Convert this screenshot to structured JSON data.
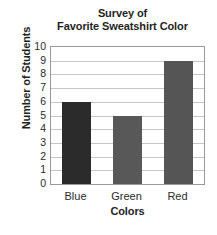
{
  "chart_data": {
    "type": "bar",
    "title": "Survey of Favorite Sweatshirt Color",
    "title_lines": [
      "Survey of",
      "Favorite Sweatshirt Color"
    ],
    "categories": [
      "Blue",
      "Green",
      "Red"
    ],
    "values": [
      6,
      5,
      9
    ],
    "xlabel": "Colors",
    "ylabel": "Number of Students",
    "ylim": [
      0,
      10
    ],
    "ytick_labels": [
      "10",
      "9",
      "8",
      "7",
      "6",
      "5",
      "4",
      "3",
      "2",
      "1",
      "0"
    ],
    "ytick_values": [
      10,
      9,
      8,
      7,
      6,
      5,
      4,
      3,
      2,
      1,
      0
    ],
    "grid": "horizontal",
    "legend": "none",
    "bar_colors": [
      "#2b2b2b",
      "#585858",
      "#555555"
    ],
    "gridline_color": "#c6c6c6",
    "frame_color": "#9a9a9a",
    "background_color": "#ffffff",
    "text_color": "#1f1f1f"
  }
}
